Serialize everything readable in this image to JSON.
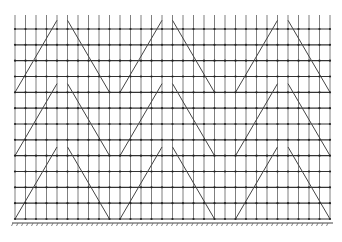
{
  "diagram": {
    "title": "",
    "columns": 31,
    "rows": 13,
    "tiers": 3,
    "tier_row_span": 4,
    "brace_groups": [
      {
        "left_col": 0,
        "apex_left_col": 4,
        "apex_right_col": 5,
        "right_col": 9
      },
      {
        "left_col": 10,
        "apex_left_col": 14,
        "apex_right_col": 15,
        "right_col": 19
      },
      {
        "left_col": 21,
        "apex_left_col": 25,
        "apex_right_col": 26,
        "right_col": 30
      }
    ],
    "support": "fixed-ground-hatched",
    "colors": {
      "lines": "#444444",
      "nodes": "#222222",
      "background": "#ffffff"
    }
  }
}
